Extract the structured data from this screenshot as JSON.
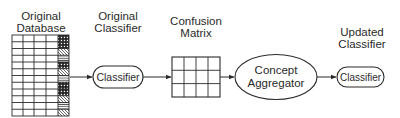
{
  "diagram": {
    "stages": [
      {
        "id": "database",
        "title_line1": "Original",
        "title_line2": "Database"
      },
      {
        "id": "orig_classifier",
        "title_line1": "Original",
        "title_line2": "Classifier",
        "node_label": "Classifier"
      },
      {
        "id": "confusion",
        "title_line1": "Confusion",
        "title_line2": "Matrix"
      },
      {
        "id": "aggregator",
        "node_line1": "Concept",
        "node_line2": "Aggregator"
      },
      {
        "id": "updated_classifier",
        "title_line1": "Updated",
        "title_line2": "Classifier",
        "node_label": "Classifier"
      }
    ],
    "database_table": {
      "rows": 12,
      "data_columns": 4,
      "pattern_sequence": [
        "dots",
        "diagonal",
        "horizontal"
      ]
    },
    "confusion_matrix": {
      "rows": 3,
      "columns": 4
    },
    "edges": [
      {
        "from": "database",
        "to": "orig_classifier"
      },
      {
        "from": "orig_classifier",
        "to": "confusion"
      },
      {
        "from": "confusion",
        "to": "aggregator"
      },
      {
        "from": "aggregator",
        "to": "updated_classifier"
      }
    ],
    "colors": {
      "stroke": "#2a2a2a",
      "background": "#ffffff"
    }
  }
}
